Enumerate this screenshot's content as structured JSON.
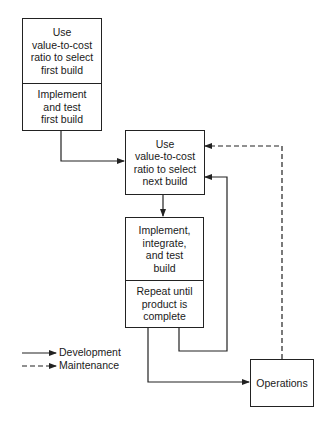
{
  "diagram": {
    "boxes": {
      "first_build": {
        "top": "Use\nvalue-to-cost\nratio to select\nfirst build",
        "bottom": "Implement\nand test\nfirst build"
      },
      "next_build": {
        "text": "Use\nvalue-to-cost\nratio to select\nnext build"
      },
      "implement_build": {
        "top": "Implement,\nintegrate,\nand test\nbuild",
        "bottom": "Repeat until\nproduct is\ncomplete"
      },
      "operations": {
        "text": "Operations"
      }
    },
    "legend": {
      "development": "Development",
      "maintenance": "Maintenance"
    },
    "edges": [
      {
        "from": "first_build",
        "to": "next_build",
        "style": "solid",
        "type": "development"
      },
      {
        "from": "next_build",
        "to": "implement_build",
        "style": "solid",
        "type": "development"
      },
      {
        "from": "implement_build",
        "to": "next_build",
        "style": "solid",
        "type": "development",
        "label": "repeat loop"
      },
      {
        "from": "implement_build",
        "to": "operations",
        "style": "solid",
        "type": "development"
      },
      {
        "from": "operations",
        "to": "next_build",
        "style": "dashed",
        "type": "maintenance"
      }
    ],
    "colors": {
      "line": "#222222",
      "background": "#ffffff"
    }
  }
}
